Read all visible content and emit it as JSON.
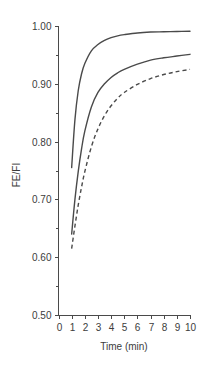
{
  "chart_data": {
    "type": "line",
    "title": "",
    "subtitle": "",
    "xlabel": "Time (min)",
    "ylabel": "FE/FI",
    "xlim": [
      0,
      10
    ],
    "ylim": [
      0.5,
      1.0
    ],
    "grid": false,
    "legend": "none",
    "x_ticks": [
      0,
      1,
      2,
      3,
      4,
      5,
      6,
      7,
      8,
      9,
      10
    ],
    "x_tick_labels": [
      "0",
      "1",
      "2",
      "3",
      "4",
      "5",
      "6",
      "7",
      "8",
      "9",
      "10"
    ],
    "y_ticks": [
      0.5,
      0.6,
      0.7,
      0.8,
      0.9,
      1.0
    ],
    "y_tick_labels": [
      "0.50",
      "0.60",
      "0.70",
      "0.80",
      "0.90",
      "1.00"
    ],
    "y_minor_ticks": [
      0.55,
      0.65,
      0.75,
      0.85,
      0.95
    ],
    "x": [
      1,
      1.25,
      1.5,
      1.75,
      2,
      2.5,
      3,
      3.5,
      4,
      4.5,
      5,
      6,
      7,
      8,
      9,
      10
    ],
    "series": [
      {
        "name": "upper curve",
        "style": "solid",
        "color": "#4a4a4a",
        "values": [
          0.755,
          0.838,
          0.888,
          0.917,
          0.935,
          0.957,
          0.968,
          0.975,
          0.98,
          0.983,
          0.985,
          0.988,
          0.9895,
          0.99,
          0.9905,
          0.991
        ]
      },
      {
        "name": "middle curve",
        "style": "solid",
        "color": "#4a4a4a",
        "values": [
          0.64,
          0.7,
          0.748,
          0.787,
          0.818,
          0.86,
          0.885,
          0.9,
          0.911,
          0.919,
          0.925,
          0.934,
          0.941,
          0.945,
          0.948,
          0.951
        ]
      },
      {
        "name": "lower curve",
        "style": "dashed",
        "color": "#4a4a4a",
        "values": [
          0.615,
          0.654,
          0.69,
          0.721,
          0.748,
          0.791,
          0.822,
          0.845,
          0.862,
          0.875,
          0.885,
          0.899,
          0.909,
          0.916,
          0.921,
          0.925
        ]
      }
    ]
  },
  "axes": {
    "y_axis_title": "FE/FI",
    "x_axis_title": "Time (min)"
  }
}
